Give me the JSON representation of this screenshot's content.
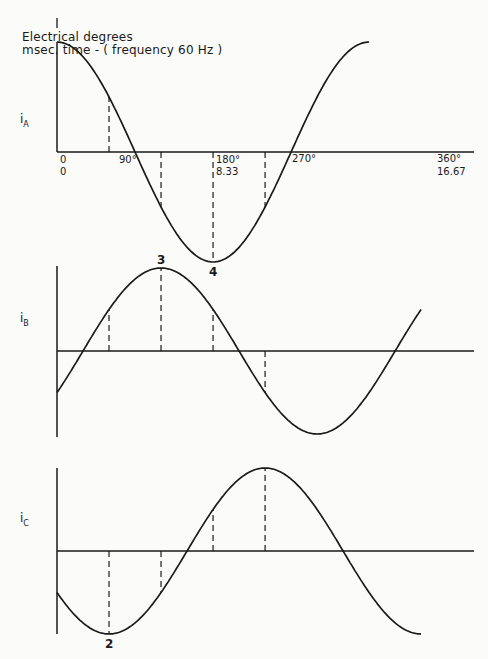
{
  "header": {
    "line1": "Electrical degrees",
    "line2": "msec. time - ( frequency 60 Hz )"
  },
  "chart_data": {
    "type": "line",
    "x_unit_degrees": [
      0,
      360
    ],
    "x_tick_labels": [
      {
        "deg": 0,
        "degree_label": "0",
        "msec_label": "0"
      },
      {
        "deg": 90,
        "degree_label": "90°",
        "msec_label": ""
      },
      {
        "deg": 180,
        "degree_label": "180°",
        "msec_label": "8.33"
      },
      {
        "deg": 270,
        "degree_label": "270°",
        "msec_label": ""
      },
      {
        "deg": 360,
        "degree_label": "360°",
        "msec_label": "16.67"
      }
    ],
    "series": [
      {
        "name": "iA",
        "label_main": "i",
        "label_sub": "A",
        "phase_deg": 0,
        "range_deg": [
          0,
          360
        ],
        "dashed_markers_deg": [
          60,
          120,
          180,
          240
        ],
        "point_label": {
          "deg": 180,
          "text": "4",
          "position": "below"
        }
      },
      {
        "name": "iB",
        "label_main": "i",
        "label_sub": "B",
        "phase_deg": 120,
        "range_deg": [
          0,
          420
        ],
        "dashed_markers_deg": [
          60,
          120,
          180,
          240
        ],
        "point_label": {
          "deg": 120,
          "text": "3",
          "position": "above"
        }
      },
      {
        "name": "iC",
        "label_main": "i",
        "label_sub": "C",
        "phase_deg": 240,
        "range_deg": [
          0,
          420
        ],
        "dashed_markers_deg": [
          60,
          120,
          180,
          240
        ],
        "point_label": {
          "deg": 60,
          "text": "2",
          "position": "below"
        }
      }
    ],
    "function": "cos(theta - phase)",
    "grid": false,
    "legend": "none"
  }
}
